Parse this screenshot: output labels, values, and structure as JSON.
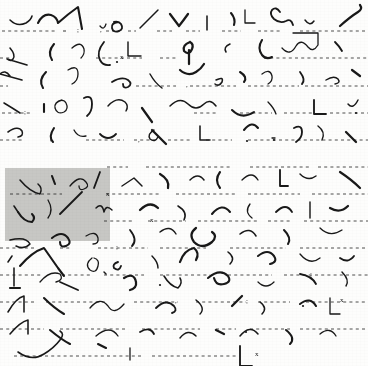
{
  "document": {
    "kind": "handwritten-shorthand-manuscript-scan",
    "title": "Shorthand Manuscript Page",
    "paper_color": "#fdfdfc",
    "ink_color": "#191919",
    "ruled_line_color": "#2b2b2b",
    "highlight_color": "#c9c9c7",
    "width": 368,
    "height": 366,
    "line_count": 13,
    "line_spacing_px": 27.2,
    "first_baseline_y": 31
  },
  "selection": {
    "name": "highlighted-region",
    "x": 5,
    "y": 168,
    "width": 105,
    "height": 73,
    "color": "#c9c9c7"
  },
  "ruled_lines": [
    {
      "y": 31,
      "segments": [
        [
          2,
          57
        ],
        [
          63,
          66
        ],
        [
          106,
          120
        ],
        [
          128,
          136
        ],
        [
          157,
          172
        ],
        [
          186,
          200
        ],
        [
          222,
          241
        ],
        [
          258,
          282
        ],
        [
          300,
          368
        ]
      ]
    },
    {
      "y": 58,
      "segments": [
        [
          0,
          10
        ],
        [
          96,
          142
        ],
        [
          160,
          178
        ],
        [
          264,
          368
        ]
      ]
    },
    {
      "y": 86,
      "segments": [
        [
          0,
          8
        ],
        [
          136,
          176
        ],
        [
          190,
          236
        ],
        [
          248,
          299
        ],
        [
          305,
          368
        ]
      ]
    },
    {
      "y": 113,
      "segments": [
        [
          2,
          32
        ],
        [
          194,
          218
        ],
        [
          240,
          272
        ],
        [
          284,
          312
        ],
        [
          330,
          368
        ]
      ]
    },
    {
      "y": 140,
      "segments": [
        [
          0,
          22
        ],
        [
          86,
          124
        ],
        [
          134,
          156
        ],
        [
          168,
          192
        ],
        [
          206,
          232
        ],
        [
          248,
          368
        ]
      ]
    },
    {
      "y": 167,
      "segments": [
        [
          107,
          128
        ],
        [
          146,
          232
        ],
        [
          250,
          312
        ],
        [
          318,
          368
        ]
      ]
    },
    {
      "y": 194,
      "segments": [
        [
          10,
          62
        ],
        [
          106,
          160
        ],
        [
          176,
          236
        ],
        [
          248,
          300
        ],
        [
          312,
          368
        ]
      ]
    },
    {
      "y": 221,
      "segments": [
        [
          104,
          132
        ],
        [
          148,
          186
        ],
        [
          198,
          258
        ],
        [
          268,
          292
        ],
        [
          304,
          368
        ]
      ]
    },
    {
      "y": 248,
      "segments": [
        [
          0,
          36
        ],
        [
          60,
          72
        ],
        [
          98,
          148
        ],
        [
          160,
          206
        ],
        [
          230,
          286
        ],
        [
          300,
          368
        ]
      ]
    },
    {
      "y": 275,
      "segments": [
        [
          0,
          42
        ],
        [
          62,
          90
        ],
        [
          104,
          144
        ],
        [
          160,
          210
        ],
        [
          228,
          272
        ],
        [
          284,
          368
        ]
      ]
    },
    {
      "y": 302,
      "segments": [
        [
          0,
          34
        ],
        [
          46,
          108
        ],
        [
          134,
          178
        ],
        [
          196,
          246
        ],
        [
          258,
          290
        ],
        [
          306,
          368
        ]
      ]
    },
    {
      "y": 329,
      "segments": [
        [
          0,
          44
        ],
        [
          60,
          126
        ],
        [
          142,
          200
        ],
        [
          216,
          236
        ],
        [
          250,
          290
        ],
        [
          300,
          368
        ]
      ]
    },
    {
      "y": 356,
      "segments": [
        [
          14,
          142
        ],
        [
          152,
          236
        ]
      ]
    }
  ],
  "marks": {
    "period_x_marks": [
      {
        "label": "x",
        "x": 120,
        "y": 59
      },
      {
        "label": "x",
        "x": 150,
        "y": 222
      },
      {
        "label": "x",
        "x": 106,
        "y": 196
      },
      {
        "label": "x",
        "x": 340,
        "y": 302
      },
      {
        "label": "x",
        "x": 255,
        "y": 356
      }
    ],
    "semicolons": [
      {
        "label": ";",
        "x": 77,
        "y": 32
      },
      {
        "label": ";",
        "x": 24,
        "y": 114
      },
      {
        "label": ";",
        "x": 116,
        "y": 249
      },
      {
        "label": ";",
        "x": 310,
        "y": 276
      },
      {
        "label": ";",
        "x": 246,
        "y": 303
      }
    ],
    "commas": [
      {
        "label": ",",
        "x": 100,
        "y": 32
      },
      {
        "label": ",",
        "x": 186,
        "y": 87
      },
      {
        "label": ",",
        "x": 138,
        "y": 142
      },
      {
        "label": ",",
        "x": 50,
        "y": 141
      },
      {
        "label": ",",
        "x": 175,
        "y": 303
      }
    ]
  },
  "ink_strokes": {
    "description": "Hand-drawn Gregg-style shorthand outlines arranged on thirteen ruled lines.",
    "line_1": [
      "M10,20 q7,7 16,3 q5,-3 6,-7",
      "M38,23 q5,-10 13,-8 q6,2 7,8 q10,-9 20,-16 l4,22",
      "M100,26 q4,5 6,-2",
      "M118,22 q-7,1 -6,6 q1,5 7,3 q5,-2 2,-7 q-2,-3 -7,-2",
      "M140,28 l18,-18",
      "M170,14 q6,8 9,12 q4,-5 9,-12",
      "M207,16 l0,14",
      "M231,13 q5,6 3,12",
      "M245,10 l0,13 l10,0",
      "M280,12 q-4,-6 -8,-2 q-3,4 2,9 q6,5 12,2 q5,-3 7,4",
      "M305,20 q5,7 9,1",
      "M340,26 q10,-9 18,-14 q5,-3 2,-7"
    ],
    "line_2": [
      "M10,48 q6,7 3,11 q-2,3 -6,0 m0,0 l20,6",
      "M54,44 q-7,8 -2,16",
      "M72,48 q9,-8 12,1 q1,5 -3,9",
      "M104,42 q-8,10 -4,18 q3,6 10,5",
      "M128,42 l0,14 l13,0",
      "M190,42 q-8,3 -6,9 q5,5 8,-2 q2,-5 -2,-7 m-1,8 l0,14",
      "M230,44 q-7,3 -4,8",
      "M262,40 q-5,8 0,15 q4,5 10,2",
      "M282,48 q8,9 14,-2 q5,-8 12,1 q5,6 10,-2 l0,-12 l-25,0",
      "M335,42 q5,5 7,9"
    ],
    "line_3": [
      "M10,76 q-5,-7 -10,-2 m0,0 l22,6",
      "M46,72 q-8,8 -3,16",
      "M68,70 q10,-6 10,4 q0,7 -6,10",
      "M112,82 q10,-6 16,-2 q5,4 0,7 q-5,2 -5,-3",
      "M150,74 q5,9 12,14",
      "M180,70 q8,7 16,2 q5,-3 8,-8",
      "M216,80 q8,-4 6,2 q-3,5 -7,2",
      "M240,72 q8,5 4,10",
      "M262,74 q8,-6 10,2 q1,5 -4,8",
      "M300,72 q6,8 2,12",
      "M326,80 q8,-5 12,-1 q3,4 -3,5",
      "M352,70 l8,6"
    ],
    "line_4": [
      "M4,103 q10,6 16,10",
      "M44,104 l0,8",
      "M62,100 q-8,2 -7,8 q2,7 9,4 q5,-3 2,-9 q-2,-4 -7,-2",
      "M84,98 q8,-4 8,6 q0,8 -5,12",
      "M108,106 q9,-10 17,-4 q4,4 1,9",
      "M142,108 l10,14",
      "M170,106 q10,-10 18,-2 q8,8 16,0 q6,-6 12,2",
      "M232,110 q10,10 22,2",
      "M268,102 q6,6 8,12",
      "M314,100 l0,14 l12,0",
      "M348,104 q5,6 10,-4"
    ],
    "line_5": [
      "M8,132 q10,-7 14,-1 q2,5 -4,6",
      "M54,128 q-6,9 -1,14",
      "M74,130 q4,8 12,6",
      "M100,134 q8,8 16,0",
      "M154,130 q-7,4 -4,9 q5,4 8,-2",
      "M152,130 l14,14",
      "M200,126 l0,14 l10,0",
      "M244,130 q8,-10 14,-2",
      "M272,138 l3,0",
      "M294,128 q8,-4 8,4 q0,6 -6,10",
      "M318,126 q8,6 4,14",
      "M346,132 l10,10"
    ],
    "line_6": [
      "M20,180 q10,12 20,14 q3,-6 -2,-10",
      "M52,176 l3,8",
      "M70,186 q10,-12 16,-4 q4,5 -2,7 q-5,2 -5,-3",
      "M100,172 l-6,16",
      "M122,186 l12,-8 l8,8",
      "M160,174 q10,6 8,14",
      "M190,180 q8,-8 14,0",
      "M220,172 q-6,8 0,16",
      "M242,180 q10,-10 16,0",
      "M280,170 l0,16 l8,0",
      "M300,174 q8,8 16,2",
      "M340,172 q12,8 20,16"
    ],
    "line_7": [
      "M14,206 l4,6",
      "M18,212 q6,10 14,10 q4,-4 0,-8",
      "M48,200 q6,10 0,18",
      "M60,214 q12,-12 22,-22",
      "M96,208 q6,-6 8,4 q2,-8 8,-2",
      "M140,210 q10,-10 18,-2",
      "M178,206 q10,6 6,14",
      "M212,214 q10,-12 18,-2",
      "M250,204 q-6,8 2,14",
      "M276,212 q10,-10 16,0",
      "M310,202 l0,16",
      "M330,208 q10,6 18,-2"
    ],
    "line_8": [
      "M10,240 q16,-4 20,4 q-6,6 -14,2",
      "M52,238 q10,-8 16,0 q4,6 -2,8 q-6,2 -6,-4",
      "M86,236 q10,-6 12,2 q1,6 -5,6",
      "M130,230 q8,10 2,16",
      "M160,232 q10,-8 16,2",
      "M196,228 q-8,6 -2,14 q8,8 18,0 q6,-6 0,-10",
      "M240,234 q10,-8 16,2",
      "M284,230 q8,8 4,14",
      "M320,228 q10,10 22,2"
    ],
    "line_9": [
      "M8,262 l4,-6",
      "M20,266 q12,-14 24,-18 l14,20 l6,8",
      "M92,258 q-8,6 -2,12 q6,4 8,-4 q2,-6 -4,-8",
      "M118,262 q-6,2 -4,6 q5,4 7,-2",
      "M152,256 q6,6 6,12",
      "M180,262 q4,-12 14,-14 q6,5 2,12",
      "M228,252 q8,6 2,12",
      "M258,256 q10,-8 16,0 q4,6 -4,8",
      "M300,254 q10,12 20,4",
      "M340,258 q8,6 14,-2"
    ],
    "line_10": [
      "M14,268 l0,18",
      "M10,288 l10,0",
      "M40,282 q10,-12 20,-8 q4,6 -4,8",
      "M60,282 l18,8",
      "M104,272 l2,2",
      "M124,278 q10,-6 12,4 q1,6 -6,8",
      "M164,276 q6,10 14,12 q5,-5 2,-10",
      "M208,278 q12,-10 20,-2 q4,6 -4,8 q-8,2 -10,-6",
      "M258,282 q8,8 16,0",
      "M300,274 q12,2 16,10",
      "M342,272 q8,8 4,14"
    ],
    "line_11": [
      "M8,312 q8,-14 16,-16 l0,16",
      "M44,298 q10,10 20,16",
      "M90,308 q10,-12 18,-2 q6,10 16,-2",
      "M156,308 q10,-10 18,-2 q4,5 -2,7",
      "M196,300 q10,8 4,14",
      "M232,306 l10,-10",
      "M260,302 q8,6 2,12",
      "M300,304 q10,-8 16,2",
      "M330,298 l0,16 l10,0"
    ],
    "line_12": [
      "M10,334 q10,-12 18,-14 l0,14",
      "M50,330 q12,10 20,14",
      "M96,336 q14,-12 22,0",
      "M140,332 q10,-6 14,2",
      "M180,338 q8,-10 16,-2",
      "M216,330 l8,4",
      "M240,336 q10,-12 18,-2",
      "M286,330 q10,8 4,14",
      "M320,334 q10,-8 16,2"
    ],
    "line_13": [
      "M18,352 q14,10 26,2 q10,-6 16,-14 q5,-6 0,-9",
      "M98,344 l8,4",
      "M130,348 l0,12",
      "M240,346 l0,20 l12,0"
    ]
  }
}
